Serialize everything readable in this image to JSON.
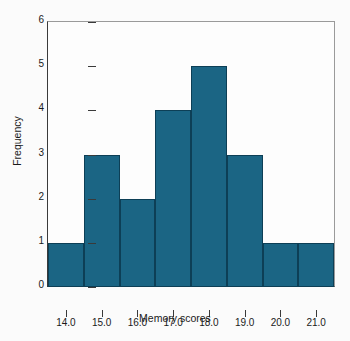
{
  "chart_data": {
    "type": "bar",
    "title": "",
    "subtitle": "",
    "xlabel": "Memory scores",
    "ylabel": "Frequency",
    "grid": false,
    "legend": false,
    "legend_position": "none",
    "bar_color": "#1b6584",
    "bar_edge_color": "#0d3f56",
    "frame_color": "#3a3a3a",
    "background_color": "#fbfbfb",
    "xlim": [
      13.5,
      21.5
    ],
    "ylim": [
      0,
      6
    ],
    "x_tick_labels": [
      "14.0",
      "15.0",
      "16.0",
      "17.0",
      "18.0",
      "19.0",
      "20.0",
      "21.0"
    ],
    "x_tick_values": [
      14.0,
      15.0,
      16.0,
      17.0,
      18.0,
      19.0,
      20.0,
      21.0
    ],
    "y_tick_labels": [
      "0",
      "1",
      "2",
      "3",
      "4",
      "5",
      "6"
    ],
    "y_tick_values": [
      0,
      1,
      2,
      3,
      4,
      5,
      6
    ],
    "bin_edges": [
      13.5,
      14.5,
      15.5,
      16.5,
      17.5,
      18.5,
      19.5,
      20.5,
      21.5
    ],
    "bin_width": 1.0,
    "categories": [
      "13.5-14.5",
      "14.5-15.5",
      "15.5-16.5",
      "16.5-17.5",
      "17.5-18.5",
      "18.5-19.5",
      "19.5-20.5",
      "20.5-21.5"
    ],
    "values": [
      1,
      3,
      2,
      4,
      5,
      3,
      1,
      1
    ],
    "bars": [
      {
        "bin_start": 13.5,
        "bin_end": 14.5,
        "center": 14.0,
        "frequency": 1
      },
      {
        "bin_start": 14.5,
        "bin_end": 15.5,
        "center": 15.0,
        "frequency": 3
      },
      {
        "bin_start": 15.5,
        "bin_end": 16.5,
        "center": 16.0,
        "frequency": 2
      },
      {
        "bin_start": 16.5,
        "bin_end": 17.5,
        "center": 17.0,
        "frequency": 4
      },
      {
        "bin_start": 17.5,
        "bin_end": 18.5,
        "center": 18.0,
        "frequency": 5
      },
      {
        "bin_start": 18.5,
        "bin_end": 19.5,
        "center": 19.0,
        "frequency": 3
      },
      {
        "bin_start": 19.5,
        "bin_end": 20.5,
        "center": 20.0,
        "frequency": 1
      },
      {
        "bin_start": 20.5,
        "bin_end": 21.5,
        "center": 21.0,
        "frequency": 1
      }
    ],
    "total_count": 20
  }
}
